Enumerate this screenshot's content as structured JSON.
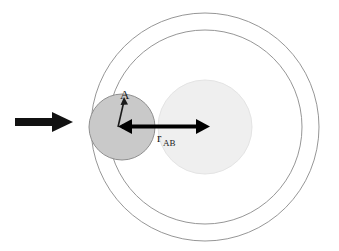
{
  "figure": {
    "background_color": "#ffffff",
    "labels": {
      "distance_main": "r",
      "distance_sub": "AB",
      "particle_a": "A"
    },
    "colors": {
      "particle_a_fill": "#c9c9c9",
      "particle_a_stroke": "#8c8c8c",
      "particle_b_fill": "#efefef",
      "particle_b_stroke": "#e2e2e2",
      "shell_stroke": "#8a8a8a",
      "arrow_color": "#111111",
      "radius_arrow_color": "#000000"
    },
    "elements": {
      "incoming_arrow": {
        "name": "incoming-velocity-arrow",
        "x_start": 15,
        "x_end": 72,
        "y": 122,
        "shaft_thickness": 8,
        "head_width": 20,
        "head_height": 22
      },
      "particle_a": {
        "name": "particle-a-circle",
        "cx": 122,
        "cy": 127,
        "r": 33
      },
      "particle_b": {
        "name": "particle-b-circle",
        "cx": 205,
        "cy": 127,
        "r": 47
      },
      "shell_inner": {
        "name": "collision-shell-inner",
        "cx": 205,
        "cy": 127,
        "r": 97
      },
      "shell_outer": {
        "name": "collision-shell-outer",
        "cx": 205,
        "cy": 127,
        "r": 114
      },
      "radius_arrow": {
        "name": "rab-double-arrow",
        "x_start": 122,
        "x_end": 205,
        "y": 127
      },
      "particle_a_pointer": {
        "name": "particle-a-pointer-arrow",
        "x_tail": 118,
        "y_tail": 127,
        "x_head": 124,
        "y_head": 99
      },
      "rab_label_position": {
        "x": 158,
        "y": 143
      },
      "a_label_position": {
        "x": 122,
        "y": 98
      }
    }
  }
}
